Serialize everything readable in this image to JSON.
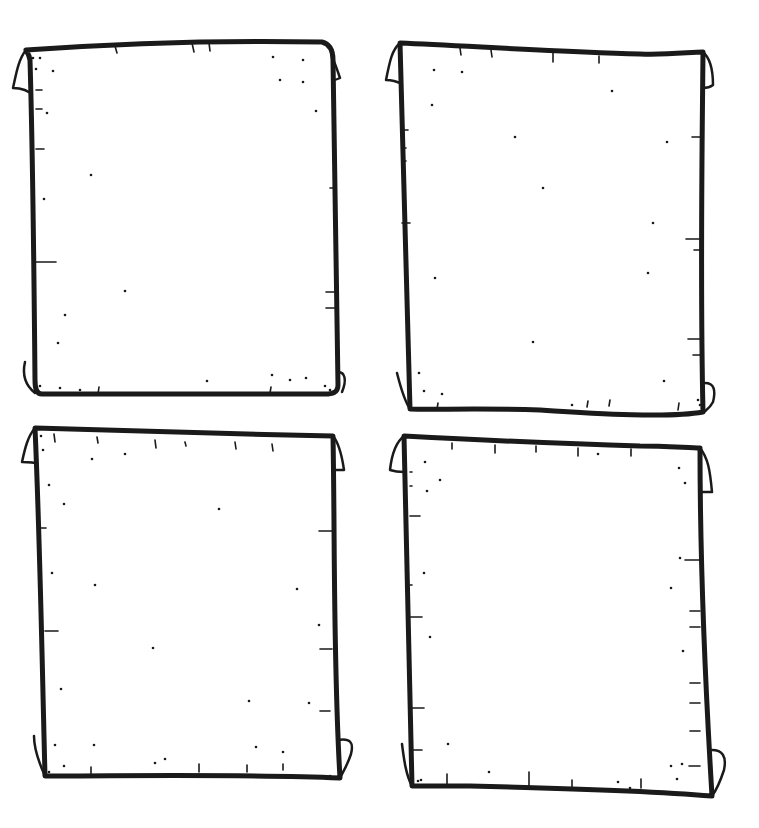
{
  "image": {
    "description": "Four blank hand-drawn parchment scrolls arranged in a 2x2 grid",
    "background": "#ffffff",
    "ink_color": "#1a1a1a"
  },
  "scrolls": [
    {
      "id": "top-left",
      "outline": "M26,50 C110,44 220,40 322,42 C330,44 333,50 333,60 C334,150 336,260 338,385 C338,393 332,394 325,394 C230,394 130,394 42,394 C36,394 35,388 35,380 C34,270 33,160 30,60 C29,54 27,52 26,50 Z",
      "curls": [
        "M26,50 C18,60 16,75 13,88 C20,88 28,90 34,96",
        "M322,42 C330,50 334,60 340,78 C336,80 333,80 333,80",
        "M25,362 C22,375 25,385 35,393",
        "M338,372 C345,372 347,380 342,392"
      ],
      "ticks": [
        [
          115,
          46,
          117,
          53
        ],
        [
          192,
          43,
          194,
          52
        ],
        [
          209,
          43,
          210,
          51
        ],
        [
          36,
          90,
          42,
          90
        ],
        [
          36,
          109,
          42,
          109
        ],
        [
          36,
          149,
          44,
          149
        ],
        [
          36,
          262,
          56,
          262
        ],
        [
          330,
          188,
          336,
          188
        ],
        [
          326,
          292,
          336,
          292
        ],
        [
          326,
          308,
          336,
          308
        ],
        [
          98,
          394,
          99,
          387
        ],
        [
          270,
          393,
          271,
          387
        ]
      ],
      "specks": [
        [
          33,
          58
        ],
        [
          40,
          58
        ],
        [
          36,
          69
        ],
        [
          53,
          71
        ],
        [
          47,
          113
        ],
        [
          91,
          175
        ],
        [
          44,
          199
        ],
        [
          125,
          291
        ],
        [
          65,
          315
        ],
        [
          58,
          343
        ],
        [
          273,
          57
        ],
        [
          303,
          60
        ],
        [
          280,
          80
        ],
        [
          303,
          82
        ],
        [
          316,
          111
        ],
        [
          207,
          381
        ],
        [
          272,
          375
        ],
        [
          290,
          380
        ],
        [
          306,
          378
        ],
        [
          40,
          386
        ],
        [
          60,
          388
        ],
        [
          80,
          390
        ],
        [
          325,
          386
        ],
        [
          330,
          390
        ]
      ]
    },
    {
      "id": "top-right",
      "outline": "M400,43 C470,46 560,52 640,54 C670,55 690,52 703,52 C702,160 700,280 703,412 C670,418 600,414 540,410 C480,408 430,410 410,409 C408,300 404,180 400,43 Z",
      "curls": [
        "M400,43 C392,50 390,60 386,80 C393,80 398,82 402,84",
        "M703,52 C710,58 713,70 713,85 C709,88 705,88 703,88",
        "M397,373 C400,385 404,400 410,409",
        "M705,383 C714,383 716,390 713,402 C710,408 706,410 704,412"
      ],
      "ticks": [
        [
          460,
          48,
          461,
          55
        ],
        [
          491,
          50,
          492,
          57
        ],
        [
          553,
          52,
          553,
          62
        ],
        [
          599,
          56,
          599,
          63
        ],
        [
          402,
          130,
          408,
          130
        ],
        [
          402,
          148,
          406,
          148
        ],
        [
          402,
          161,
          406,
          161
        ],
        [
          402,
          223,
          410,
          223
        ],
        [
          692,
          137,
          700,
          137
        ],
        [
          686,
          239,
          700,
          239
        ],
        [
          694,
          250,
          700,
          250
        ],
        [
          688,
          339,
          700,
          339
        ],
        [
          693,
          355,
          700,
          355
        ],
        [
          437,
          409,
          438,
          403
        ],
        [
          587,
          407,
          588,
          401
        ],
        [
          609,
          406,
          610,
          400
        ],
        [
          678,
          410,
          679,
          403
        ]
      ],
      "specks": [
        [
          434,
          70
        ],
        [
          462,
          72
        ],
        [
          432,
          105
        ],
        [
          612,
          91
        ],
        [
          515,
          137
        ],
        [
          667,
          142
        ],
        [
          543,
          188
        ],
        [
          653,
          223
        ],
        [
          435,
          278
        ],
        [
          648,
          273
        ],
        [
          533,
          342
        ],
        [
          419,
          373
        ],
        [
          424,
          391
        ],
        [
          442,
          394
        ],
        [
          664,
          381
        ],
        [
          572,
          405
        ],
        [
          698,
          400
        ],
        [
          700,
          405
        ]
      ]
    },
    {
      "id": "bottom-left",
      "outline": "M35,428 C120,430 230,434 333,436 C335,540 333,660 340,778 C250,774 130,776 45,776 C42,660 40,540 35,428 Z",
      "curls": [
        "M35,428 C28,436 25,448 22,462 C28,462 34,462 38,464",
        "M333,436 C338,442 342,456 344,470 C339,470 336,470 333,470",
        "M34,736 C34,750 40,765 45,776",
        "M338,740 C350,738 354,742 351,754 C347,766 343,772 340,778"
      ],
      "ticks": [
        [
          54,
          434,
          55,
          442
        ],
        [
          97,
          437,
          98,
          443
        ],
        [
          155,
          440,
          156,
          448
        ],
        [
          185,
          442,
          186,
          446
        ],
        [
          235,
          442,
          236,
          449
        ],
        [
          272,
          444,
          273,
          451
        ],
        [
          40,
          528,
          46,
          528
        ],
        [
          45,
          631,
          58,
          631
        ],
        [
          319,
          531,
          332,
          531
        ],
        [
          320,
          649,
          332,
          649
        ],
        [
          320,
          711,
          330,
          711
        ],
        [
          91,
          775,
          91,
          767
        ],
        [
          199,
          772,
          199,
          764
        ],
        [
          247,
          772,
          247,
          765
        ],
        [
          283,
          770,
          283,
          764
        ]
      ],
      "specks": [
        [
          41,
          436
        ],
        [
          43,
          450
        ],
        [
          92,
          459
        ],
        [
          125,
          454
        ],
        [
          49,
          485
        ],
        [
          64,
          504
        ],
        [
          219,
          509
        ],
        [
          52,
          573
        ],
        [
          95,
          585
        ],
        [
          297,
          589
        ],
        [
          319,
          625
        ],
        [
          153,
          648
        ],
        [
          61,
          689
        ],
        [
          249,
          701
        ],
        [
          309,
          703
        ],
        [
          55,
          745
        ],
        [
          94,
          745
        ],
        [
          256,
          747
        ],
        [
          283,
          752
        ],
        [
          64,
          766
        ],
        [
          155,
          763
        ],
        [
          165,
          759
        ],
        [
          49,
          772
        ],
        [
          330,
          776
        ]
      ]
    },
    {
      "id": "bottom-right",
      "outline": "M404,436 C480,440 570,444 640,446 C665,446 690,448 700,448 C700,560 705,680 712,796 C640,790 560,788 470,786 C440,786 420,786 412,786 C410,660 406,540 404,436 Z",
      "curls": [
        "M404,436 C396,442 392,452 390,470 C396,472 400,472 404,472",
        "M700,448 C708,458 710,470 712,492 C705,492 700,492 700,492",
        "M402,744 C404,760 406,775 412,786",
        "M712,750 C722,750 727,756 724,770 C720,782 715,792 712,796"
      ],
      "ticks": [
        [
          452,
          443,
          452,
          449
        ],
        [
          495,
          445,
          495,
          453
        ],
        [
          536,
          446,
          536,
          452
        ],
        [
          578,
          448,
          578,
          456
        ],
        [
          631,
          449,
          631,
          456
        ],
        [
          410,
          472,
          412,
          472
        ],
        [
          410,
          486,
          412,
          486
        ],
        [
          410,
          516,
          420,
          516
        ],
        [
          410,
          585,
          412,
          585
        ],
        [
          410,
          617,
          422,
          617
        ],
        [
          410,
          708,
          424,
          708
        ],
        [
          410,
          750,
          422,
          750
        ],
        [
          685,
          560,
          700,
          560
        ],
        [
          690,
          611,
          700,
          611
        ],
        [
          690,
          627,
          700,
          627
        ],
        [
          690,
          683,
          700,
          683
        ],
        [
          690,
          703,
          700,
          703
        ],
        [
          690,
          731,
          700,
          731
        ],
        [
          689,
          766,
          700,
          766
        ],
        [
          447,
          786,
          447,
          774
        ],
        [
          529,
          786,
          529,
          772
        ],
        [
          572,
          787,
          572,
          780
        ],
        [
          641,
          788,
          641,
          779
        ]
      ],
      "specks": [
        [
          425,
          462
        ],
        [
          440,
          480
        ],
        [
          427,
          491
        ],
        [
          598,
          454
        ],
        [
          679,
          468
        ],
        [
          685,
          483
        ],
        [
          424,
          573
        ],
        [
          680,
          558
        ],
        [
          671,
          588
        ],
        [
          430,
          637
        ],
        [
          683,
          651
        ],
        [
          448,
          744
        ],
        [
          489,
          772
        ],
        [
          671,
          766
        ],
        [
          682,
          764
        ],
        [
          677,
          779
        ],
        [
          418,
          781
        ],
        [
          421,
          780
        ],
        [
          618,
          782
        ],
        [
          630,
          788
        ]
      ]
    }
  ]
}
